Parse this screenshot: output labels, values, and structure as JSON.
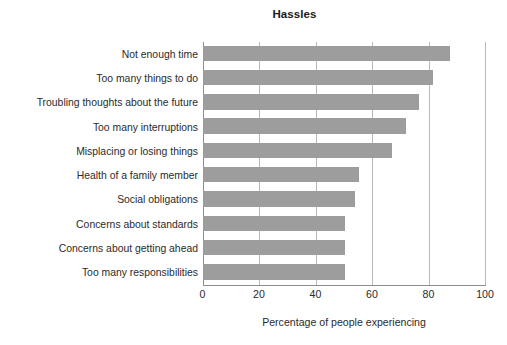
{
  "chart_data": {
    "type": "bar",
    "orientation": "horizontal",
    "title": "Hassles",
    "xlabel": "Percentage of people experiencing",
    "ylabel": "",
    "xlim": [
      0,
      100
    ],
    "xticks": [
      0,
      20,
      40,
      60,
      80,
      100
    ],
    "xtick_labels": [
      "0",
      "20",
      "40",
      "60",
      "80",
      "100"
    ],
    "grid": true,
    "grid_axis": "x",
    "legend": false,
    "bar_color": "#9d9d9d",
    "categories": [
      "Not enough time",
      "Too many things to do",
      "Troubling thoughts about the future",
      "Too many interruptions",
      "Misplacing or losing things",
      "Health of a family member",
      "Social obligations",
      "Concerns about standards",
      "Concerns about getting ahead",
      "Too many responsibilities"
    ],
    "values": [
      87.5,
      81.5,
      76.5,
      72.0,
      67.0,
      55.5,
      54.0,
      50.5,
      50.5,
      50.5
    ]
  }
}
